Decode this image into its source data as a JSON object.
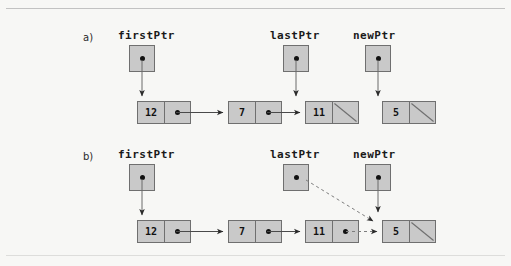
{
  "figure": {
    "kind": "linked-list-insert-at-tail",
    "background_color": "#f7f7f5",
    "box_fill": "#c9c9c9",
    "box_border": "#6f6f6f",
    "ink_color": "#111111",
    "dashed_color": "#7d7d7d"
  },
  "sections": [
    {
      "label": "a)",
      "pointers": [
        {
          "name": "firstPtr",
          "has_dot": true
        },
        {
          "name": "lastPtr",
          "has_dot": true
        },
        {
          "name": "newPtr",
          "has_dot": true
        }
      ],
      "nodes": [
        {
          "value": "12",
          "link": "dot"
        },
        {
          "value": "7",
          "link": "dot"
        },
        {
          "value": "11",
          "link": "null-slash"
        },
        {
          "value": "5",
          "link": "null-slash"
        }
      ]
    },
    {
      "label": "b)",
      "pointers": [
        {
          "name": "firstPtr",
          "has_dot": true
        },
        {
          "name": "lastPtr",
          "has_dot": true
        },
        {
          "name": "newPtr",
          "has_dot": true
        }
      ],
      "nodes": [
        {
          "value": "12",
          "link": "dot"
        },
        {
          "value": "7",
          "link": "dot"
        },
        {
          "value": "11",
          "link": "dot"
        },
        {
          "value": "5",
          "link": "null-slash"
        }
      ]
    }
  ],
  "connectors": {
    "solid_label": "solid-arrow",
    "dashed_label": "dashed-arrow"
  }
}
